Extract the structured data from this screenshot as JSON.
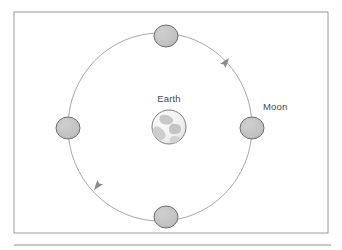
{
  "figure": {
    "title_text": "",
    "caption_text": "",
    "frame": {
      "name": "diagram-frame",
      "x": 14,
      "y": 12,
      "width": 314,
      "height": 221,
      "stroke_color": "#9a9a9a",
      "fill_color": "#ffffff"
    },
    "rule": {
      "name": "bottom-rule",
      "x1": 14,
      "y1": 245,
      "x2": 331,
      "y2": 245,
      "stroke_color": "#b6b6b6"
    }
  },
  "diagram": {
    "type": "orbit-diagram",
    "background_color": "#ffffff",
    "orbit": {
      "name": "moon-orbit-path",
      "label": "orbit",
      "center_x": 160,
      "center_y": 127,
      "radius_x": 92,
      "radius_y": 94,
      "stroke_color": "#9e9e9e",
      "stroke_width": 0.9,
      "direction": "counterclockwise"
    },
    "earth": {
      "name": "earth-body",
      "label": "Earth",
      "center_x": 169,
      "center_y": 127,
      "radius": 17,
      "fill_color": "#f2f2f2",
      "stroke_color": "#7d7d7d",
      "continent_color": "#c8c8c8"
    },
    "earth_label": {
      "name": "earth-label",
      "text": "Earth",
      "x": 169,
      "y": 102,
      "anchor": "middle",
      "color": "#4a4a4a"
    },
    "moon_label": {
      "name": "moon-label",
      "text": "Moon",
      "x": 263,
      "y": 110,
      "anchor": "start",
      "color": "#4a4a4a"
    },
    "moons": [
      {
        "name": "moon-position-top",
        "position": "top",
        "center_x": 166,
        "center_y": 36,
        "radius_x": 12,
        "radius_y": 11,
        "fill_color": "#c2c2c2",
        "stroke_color": "#6e6e6e"
      },
      {
        "name": "moon-position-right",
        "position": "right",
        "center_x": 252,
        "center_y": 128,
        "radius_x": 12,
        "radius_y": 11,
        "fill_color": "#c2c2c2",
        "stroke_color": "#6e6e6e"
      },
      {
        "name": "moon-position-bottom",
        "position": "bottom",
        "center_x": 166,
        "center_y": 217,
        "radius_x": 12,
        "radius_y": 11,
        "fill_color": "#c2c2c2",
        "stroke_color": "#6e6e6e"
      },
      {
        "name": "moon-position-left",
        "position": "left",
        "center_x": 68,
        "center_y": 128,
        "radius_x": 12,
        "radius_y": 11,
        "fill_color": "#c2c2c2",
        "stroke_color": "#6e6e6e"
      }
    ],
    "arrows": [
      {
        "name": "orbit-direction-arrow-upper-right",
        "position": "upper-right",
        "tip_x": 229,
        "tip_y": 58,
        "angle_deg": -52,
        "color": "#8a8a8a",
        "meaning": "counterclockwise motion"
      },
      {
        "name": "orbit-direction-arrow-lower-left",
        "position": "lower-left",
        "tip_x": 94,
        "tip_y": 190,
        "angle_deg": 128,
        "color": "#8a8a8a",
        "meaning": "counterclockwise motion"
      }
    ]
  }
}
